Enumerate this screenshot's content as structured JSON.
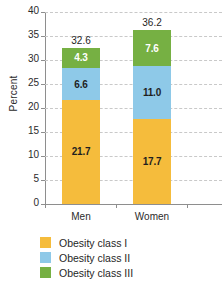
{
  "chart_data": {
    "type": "bar",
    "stacked": true,
    "title": "",
    "xlabel": "",
    "ylabel": "Percent",
    "ylim": [
      0,
      40
    ],
    "ytick_step": 5,
    "yticks": [
      "0",
      "5",
      "10",
      "15",
      "20",
      "25",
      "30",
      "35",
      "40"
    ],
    "grid": true,
    "legend_position": "bottom-left",
    "categories": [
      "Men",
      "Women"
    ],
    "series": [
      {
        "name": "Obesity class I",
        "color": "#f5bc3c",
        "label_color": "dark",
        "values": [
          21.7,
          17.7
        ],
        "labels": [
          "21.7",
          "17.7"
        ]
      },
      {
        "name": "Obesity class II",
        "color": "#8ec9e8",
        "label_color": "dark",
        "values": [
          6.6,
          11.0
        ],
        "labels": [
          "6.6",
          "11.0"
        ]
      },
      {
        "name": "Obesity class III",
        "color": "#76b043",
        "label_color": "light",
        "values": [
          4.3,
          7.6
        ],
        "labels": [
          "4.3",
          "7.6"
        ]
      }
    ],
    "totals": [
      32.6,
      36.2
    ],
    "total_labels": [
      "32.6",
      "36.2"
    ]
  },
  "axes": {
    "y_title": "Percent",
    "tick_40": "40",
    "tick_35": "35",
    "tick_30": "30",
    "tick_25": "25",
    "tick_20": "20",
    "tick_15": "15",
    "tick_10": "10",
    "tick_5": "5",
    "tick_0": "0"
  },
  "categories": {
    "men": "Men",
    "women": "Women"
  },
  "bars": {
    "men": {
      "total": "32.6",
      "class1": "21.7",
      "class2": "6.6",
      "class3": "4.3"
    },
    "women": {
      "total": "36.2",
      "class1": "17.7",
      "class2": "11.0",
      "class3": "7.6"
    }
  },
  "legend": {
    "items": [
      {
        "label": "Obesity class I",
        "color": "#f5bc3c"
      },
      {
        "label": "Obesity class II",
        "color": "#8ec9e8"
      },
      {
        "label": "Obesity class III",
        "color": "#76b043"
      }
    ]
  },
  "colors": {
    "class1": "#f5bc3c",
    "class2": "#8ec9e8",
    "class3": "#76b043",
    "grid": "#c9c9c9",
    "axis": "#8e8e8e",
    "text": "#1f1f1f",
    "background": "#ffffff"
  }
}
